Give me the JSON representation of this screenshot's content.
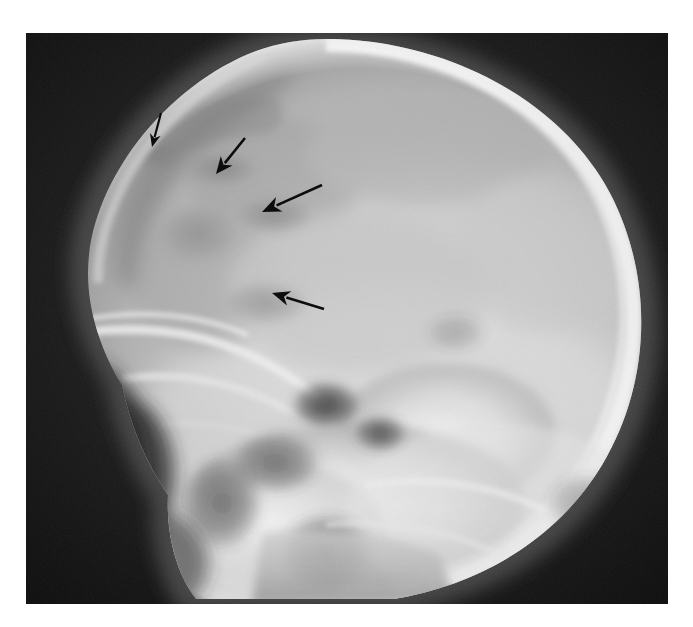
{
  "figure": {
    "domain": "medical-radiograph",
    "modality": "X-ray",
    "view": "lateral skull",
    "caption": "",
    "canvas": {
      "width": 693,
      "height": 627
    },
    "page_background": "#ffffff",
    "film_border": {
      "x": 26,
      "y": 33,
      "width": 642,
      "height": 571
    }
  },
  "palette": {
    "page_white": "#ffffff",
    "film_background_black": "#121212",
    "background_dark": "#1a1a1a",
    "soft_tissue_dark": "#3a3a3a",
    "diploe_mid_gray": "#7e7e7e",
    "cranial_vault_gray": "#b9b9b9",
    "bone_bright": "#e3e3e3",
    "bone_brightest": "#f2f2f2",
    "lucent_band": "#9a9a9a",
    "arrow_black": "#0d0d0d"
  },
  "radiograph": {
    "label": "lateral-skull-xray",
    "description": "Lateral projection radiograph of the skull showing the cranial vault, skull base, facial bones and cervical region.",
    "regions": [
      {
        "name": "cranial-vault",
        "tone": "light-gray"
      },
      {
        "name": "calvarial-outer-table",
        "tone": "bright"
      },
      {
        "name": "scalp-soft-tissue",
        "tone": "dark-gray"
      },
      {
        "name": "frontal-sinus",
        "tone": "dark"
      },
      {
        "name": "orbital-roof",
        "tone": "bright"
      },
      {
        "name": "sphenoid-ridge",
        "tone": "bright"
      },
      {
        "name": "petrous-temporal-bone",
        "tone": "bright"
      },
      {
        "name": "sella-turcica",
        "tone": "mid-gray"
      },
      {
        "name": "facial-bones",
        "tone": "bright"
      },
      {
        "name": "mandible-ramus",
        "tone": "mid-gray"
      },
      {
        "name": "air-background",
        "tone": "black"
      }
    ]
  },
  "annotations": {
    "count": 4,
    "color": "#0d0d0d",
    "arrows": [
      {
        "id": "arrow-1",
        "name": "annotation-arrow-1",
        "target": "lucent-lesion-anterior-superior",
        "tail": {
          "x": 161,
          "y": 113
        },
        "head": {
          "x": 152,
          "y": 147
        },
        "shaft_width": 2.2,
        "head_length": 13,
        "head_width": 11,
        "length_px": 35
      },
      {
        "id": "arrow-2",
        "name": "annotation-arrow-2",
        "target": "lucent-lesion-superior",
        "tail": {
          "x": 245,
          "y": 138
        },
        "head": {
          "x": 216,
          "y": 174
        },
        "shaft_width": 2.6,
        "head_length": 17,
        "head_width": 15,
        "length_px": 46
      },
      {
        "id": "arrow-3",
        "name": "annotation-arrow-3",
        "target": "lucent-lesion-mid",
        "tail": {
          "x": 322,
          "y": 185
        },
        "head": {
          "x": 262,
          "y": 212
        },
        "shaft_width": 2.6,
        "head_length": 19,
        "head_width": 16,
        "length_px": 66
      },
      {
        "id": "arrow-4",
        "name": "annotation-arrow-4",
        "target": "lucent-lesion-inferior",
        "tail": {
          "x": 324,
          "y": 309
        },
        "head": {
          "x": 272,
          "y": 293
        },
        "shaft_width": 2.6,
        "head_length": 18,
        "head_width": 15,
        "length_px": 54
      }
    ]
  }
}
